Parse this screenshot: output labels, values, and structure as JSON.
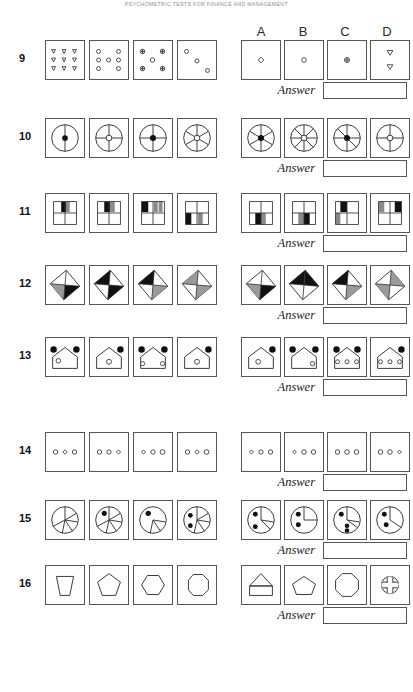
{
  "header": {
    "title": "PSYCHOMETRIC TESTS FOR FINANCE AND MANAGEMENT"
  },
  "columns": {
    "letters": [
      "A",
      "B",
      "C",
      "D"
    ]
  },
  "answer": {
    "label": "Answer",
    "value": ""
  },
  "rows": [
    {
      "number": "9",
      "top": 40,
      "answer_top": 82,
      "questions": [
        {
          "name": "grid-3x3-triangles",
          "desc": "nine down-triangles in 3 by 3 grid"
        },
        {
          "name": "grid-8-circles",
          "desc": "eight small circles ring pattern"
        },
        {
          "name": "grid-5-plus-circles",
          "desc": "five circles with plus marks"
        },
        {
          "name": "grid-3-circles-diagonal",
          "desc": "three circles on a diagonal"
        }
      ],
      "options": [
        {
          "letter": "A",
          "name": "option-small-diamond",
          "desc": "single small diamond"
        },
        {
          "letter": "B",
          "name": "option-small-circle",
          "desc": "single small circle"
        },
        {
          "letter": "C",
          "name": "option-circle-plus",
          "desc": "circle with plus mark"
        },
        {
          "letter": "D",
          "name": "option-two-triangles",
          "desc": "two down-triangles"
        }
      ]
    },
    {
      "number": "10",
      "top": 118,
      "answer_top": 160,
      "questions": [
        {
          "name": "wheel-2-spoke-filled",
          "desc": "circle vertical diameter filled hub"
        },
        {
          "name": "wheel-4-spoke-open",
          "desc": "circle four spokes open hub"
        },
        {
          "name": "wheel-4-spoke-filled",
          "desc": "circle four spokes filled hub"
        },
        {
          "name": "wheel-5-spoke-open",
          "desc": "circle five spokes open hub"
        }
      ],
      "options": [
        {
          "letter": "A",
          "name": "option-wheel-6-spoke-filled",
          "desc": "circle six spokes filled hub"
        },
        {
          "letter": "B",
          "name": "option-wheel-8-spoke-open",
          "desc": "circle eight spokes open hub"
        },
        {
          "letter": "C",
          "name": "option-wheel-5-spoke-filled",
          "desc": "circle five spokes filled hub"
        },
        {
          "letter": "D",
          "name": "option-wheel-4-spoke-open",
          "desc": "circle four spokes open hub"
        }
      ]
    },
    {
      "number": "11",
      "top": 193,
      "answer_top": 235,
      "questions": [
        {
          "name": "grid-shade-top-black-gray",
          "desc": "quad grid top cells black and gray"
        },
        {
          "name": "grid-shade-top-black-gray-2",
          "desc": "quad grid top cells black gray variant"
        },
        {
          "name": "grid-shade-top-left-black",
          "desc": "quad grid top left black gray bars"
        },
        {
          "name": "grid-shade-bottom-black",
          "desc": "quad grid bottom left black gray"
        }
      ],
      "options": [
        {
          "letter": "A",
          "name": "option-grid-bottom-black-gray",
          "desc": "bottom left black bottom right gray"
        },
        {
          "letter": "B",
          "name": "option-grid-bottom-gray-black",
          "desc": "bottom left gray bottom right black"
        },
        {
          "letter": "C",
          "name": "option-grid-left-gray-black",
          "desc": "left column gray and black"
        },
        {
          "letter": "D",
          "name": "option-grid-top-gray-black",
          "desc": "top row gray and black"
        }
      ]
    },
    {
      "number": "12",
      "top": 265,
      "answer_top": 307,
      "questions": [
        {
          "name": "diamond-quad-gray-black",
          "desc": "tilted square gray left black bottom"
        },
        {
          "name": "diamond-quad-black-black",
          "desc": "tilted square black top black bottom"
        },
        {
          "name": "diamond-quad-black-gray",
          "desc": "tilted square black top gray bottom"
        },
        {
          "name": "diamond-quad-gray-gray",
          "desc": "tilted square gray halves"
        }
      ],
      "options": [
        {
          "letter": "A",
          "name": "option-diamond-gray-black",
          "desc": "tilted square gray and black quadrants"
        },
        {
          "letter": "B",
          "name": "option-diamond-black-white",
          "desc": "tilted square black and white quadrants"
        },
        {
          "letter": "C",
          "name": "option-diamond-black-gray",
          "desc": "tilted square black gray quadrants"
        },
        {
          "letter": "D",
          "name": "option-diamond-gray-white",
          "desc": "tilted square gray white quadrants"
        }
      ]
    },
    {
      "number": "13",
      "top": 337,
      "answer_top": 379,
      "questions": [
        {
          "name": "house-2dots-top-1open",
          "desc": "house two filled dots one open circle"
        },
        {
          "name": "house-1dot-right-1open",
          "desc": "house one filled dot right one open"
        },
        {
          "name": "house-2dots-2open",
          "desc": "house two filled dots two open circles"
        },
        {
          "name": "house-1dot-1open",
          "desc": "house one filled dot one open circle"
        }
      ],
      "options": [
        {
          "letter": "A",
          "name": "option-house-1dot-1open",
          "desc": "house one dot top right one open"
        },
        {
          "letter": "B",
          "name": "option-house-2dots-1open",
          "desc": "house two dots one open right"
        },
        {
          "letter": "C",
          "name": "option-house-2dots-3open",
          "desc": "house two dots three open circles"
        },
        {
          "letter": "D",
          "name": "option-house-1dot-3open",
          "desc": "house one dot three open circles"
        }
      ]
    },
    {
      "number": "14",
      "top": 432,
      "answer_top": 474,
      "questions": [
        {
          "name": "trio-circle-diamond-circle",
          "desc": "circle diamond circle"
        },
        {
          "name": "trio-circle-circle-diamond",
          "desc": "circle circle diamond"
        },
        {
          "name": "trio-diamond-circle-circle",
          "desc": "diamond circle circle"
        },
        {
          "name": "trio-circle-diamond-circle-2",
          "desc": "circle diamond circle variant"
        }
      ],
      "options": [
        {
          "letter": "A",
          "name": "option-trio-diamond-circle-circle",
          "desc": "diamond circle circle"
        },
        {
          "letter": "B",
          "name": "option-trio-diamond-circle-circle-2",
          "desc": "diamond circle circle variant"
        },
        {
          "letter": "C",
          "name": "option-trio-circle-circle-circle",
          "desc": "three circles"
        },
        {
          "letter": "D",
          "name": "option-trio-circle-circle-diamond",
          "desc": "circle circle diamond"
        }
      ]
    },
    {
      "number": "15",
      "top": 500,
      "answer_top": 542,
      "questions": [
        {
          "name": "pie-segments-no-dot",
          "desc": "segmented circle no dots"
        },
        {
          "name": "pie-segments-1dot",
          "desc": "segmented circle one dot"
        },
        {
          "name": "pie-segments-1dot-upper",
          "desc": "segmented circle one upper dot"
        },
        {
          "name": "pie-segments-2dots",
          "desc": "segmented circle two dots"
        }
      ],
      "options": [
        {
          "letter": "A",
          "name": "option-pie-2dots",
          "desc": "segmented circle two dots"
        },
        {
          "letter": "B",
          "name": "option-pie-2dots-left",
          "desc": "segmented circle two left dots"
        },
        {
          "letter": "C",
          "name": "option-pie-3dots",
          "desc": "segmented circle three dots"
        },
        {
          "letter": "D",
          "name": "option-pie-2dots-stack",
          "desc": "segmented circle two stacked dots"
        }
      ]
    },
    {
      "number": "16",
      "top": 565,
      "answer_top": 607,
      "questions": [
        {
          "name": "shape-trapezoid",
          "desc": "trapezoid narrowing downward"
        },
        {
          "name": "shape-pentagon",
          "desc": "pentagon"
        },
        {
          "name": "shape-hexagon",
          "desc": "hexagon"
        },
        {
          "name": "shape-heptagon",
          "desc": "heptagon"
        }
      ],
      "options": [
        {
          "letter": "A",
          "name": "option-house-pentagon",
          "desc": "house shape triangle over square"
        },
        {
          "letter": "B",
          "name": "option-pentagon-wide",
          "desc": "wide pentagon"
        },
        {
          "letter": "C",
          "name": "option-octagon",
          "desc": "octagon"
        },
        {
          "letter": "D",
          "name": "option-circle-cross",
          "desc": "circle with cross notches"
        }
      ]
    }
  ]
}
